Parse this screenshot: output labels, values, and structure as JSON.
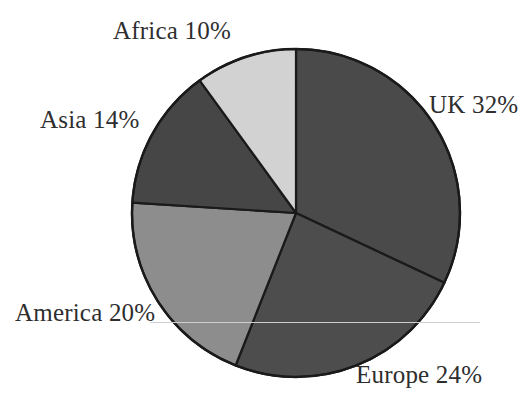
{
  "chart_data": {
    "type": "pie",
    "title": "",
    "subtitle": "",
    "xlabel": "",
    "ylabel": "",
    "legend_position": "none",
    "grid": false,
    "units": "percent",
    "start_angle_deg": 0,
    "direction": "clockwise",
    "categories": [
      "UK",
      "Europe",
      "America",
      "Asia",
      "Africa"
    ],
    "values": [
      32,
      24,
      20,
      14,
      10
    ],
    "slices": [
      {
        "name": "UK",
        "value": 32,
        "label": "UK 32%",
        "label_text": "UK 32%",
        "color": "#4a4a4a",
        "start_angle_deg": 0,
        "end_angle_deg": 115.2
      },
      {
        "name": "Europe",
        "value": 24,
        "label": "Europe 24%",
        "label_text": "Europe 24%",
        "color": "#4d4d4d",
        "start_angle_deg": 115.2,
        "end_angle_deg": 201.6
      },
      {
        "name": "America",
        "value": 20,
        "label": "America 20%",
        "label_text": "America 20%",
        "color": "#8d8d8d",
        "start_angle_deg": 201.6,
        "end_angle_deg": 273.6
      },
      {
        "name": "Asia",
        "value": 14,
        "label": "Asia 14%",
        "label_text": "Asia 14%",
        "color": "#464646",
        "start_angle_deg": 273.6,
        "end_angle_deg": 324.0
      },
      {
        "name": "Africa",
        "value": 10,
        "label": "Africa 10%",
        "label_text": "Africa 10%",
        "color": "#d2d2d2",
        "start_angle_deg": 324.0,
        "end_angle_deg": 360.0
      }
    ],
    "labels": {
      "uk": "UK 32%",
      "europe": "Europe 24%",
      "america": "America 20%",
      "asia": "Asia 14%",
      "africa": "Africa 10%"
    },
    "colors": {
      "uk": "#4a4a4a",
      "europe": "#4d4d4d",
      "america": "#8d8d8d",
      "asia": "#464646",
      "africa": "#d2d2d2",
      "outline": "#1a1a1a",
      "background": "#ffffff",
      "text": "#2e2e2e",
      "leader": "#cfcfcf"
    },
    "geometry": {
      "center_x": 296,
      "center_y": 213,
      "radius": 164
    }
  }
}
